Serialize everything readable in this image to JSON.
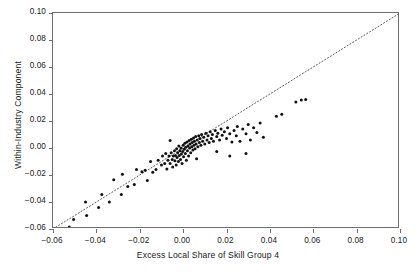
{
  "chart_data": {
    "type": "scatter",
    "title": "",
    "xlabel": "Excess Local Share of Skill Group 4",
    "ylabel": "Within-Industry Component",
    "xlim": [
      -0.06,
      0.1
    ],
    "ylim": [
      -0.06,
      0.1
    ],
    "xticks": [
      -0.06,
      -0.04,
      -0.02,
      0.0,
      0.02,
      0.04,
      0.06,
      0.08,
      0.1
    ],
    "xtick_labels": [
      "-0.06",
      "-0.04",
      "-0.02",
      "0.00",
      "0.02",
      "0.04",
      "0.06",
      "0.08",
      "0.10"
    ],
    "yticks": [
      -0.06,
      -0.04,
      -0.02,
      0.0,
      0.02,
      0.04,
      0.06,
      0.08,
      0.1
    ],
    "ytick_labels": [
      "-0.06",
      "-0.04",
      "-0.02",
      "0.00",
      "0.02",
      "0.04",
      "0.06",
      "0.08",
      "0.10"
    ],
    "grid": false,
    "legend": false,
    "marker_color": "#111111",
    "marker_size": 3.0,
    "reference_line": {
      "name": "45-degree identity line",
      "style": "dotted",
      "color": "#5a5a5a",
      "x0": -0.06,
      "y0": -0.06,
      "x1": 0.1,
      "y1": 0.1
    },
    "series": [
      {
        "name": "Commuting zones",
        "points": [
          [
            -0.0525,
            -0.0585
          ],
          [
            -0.0505,
            -0.053
          ],
          [
            -0.0445,
            -0.05
          ],
          [
            -0.045,
            -0.04
          ],
          [
            -0.0375,
            -0.0345
          ],
          [
            -0.034,
            -0.04
          ],
          [
            -0.032,
            -0.0235
          ],
          [
            -0.0285,
            -0.0345
          ],
          [
            -0.0255,
            -0.0285
          ],
          [
            -0.0225,
            -0.027
          ],
          [
            -0.0215,
            -0.016
          ],
          [
            -0.019,
            -0.0175
          ],
          [
            -0.0175,
            -0.0165
          ],
          [
            -0.015,
            -0.01
          ],
          [
            -0.014,
            -0.018
          ],
          [
            -0.0125,
            -0.016
          ],
          [
            -0.0115,
            -0.009
          ],
          [
            -0.01,
            -0.0125
          ],
          [
            -0.0095,
            -0.006
          ],
          [
            -0.0085,
            -0.0115
          ],
          [
            -0.008,
            -0.004
          ],
          [
            -0.0075,
            -0.0155
          ],
          [
            -0.007,
            -0.009
          ],
          [
            -0.0065,
            -0.006
          ],
          [
            -0.006,
            -0.0115
          ],
          [
            -0.0055,
            -0.0035
          ],
          [
            -0.005,
            -0.0085
          ],
          [
            -0.0048,
            -0.014
          ],
          [
            -0.0045,
            -0.006
          ],
          [
            -0.004,
            -0.002
          ],
          [
            -0.0038,
            -0.0095
          ],
          [
            -0.0035,
            -0.0055
          ],
          [
            -0.0032,
            -0.0125
          ],
          [
            -0.003,
            -0.0005
          ],
          [
            -0.0028,
            -0.007
          ],
          [
            -0.0025,
            -0.0035
          ],
          [
            -0.0022,
            -0.01
          ],
          [
            -0.002,
            0.0015
          ],
          [
            -0.0018,
            -0.0055
          ],
          [
            -0.0015,
            -0.002
          ],
          [
            -0.0012,
            -0.0085
          ],
          [
            -0.001,
            0.0
          ],
          [
            -0.0008,
            -0.0045
          ],
          [
            -0.0005,
            -0.0115
          ],
          [
            -0.0002,
            -0.0025
          ],
          [
            0.0,
            0.002
          ],
          [
            0.0002,
            -0.0065
          ],
          [
            0.0005,
            -0.001
          ],
          [
            0.0008,
            0.0035
          ],
          [
            0.001,
            -0.004
          ],
          [
            0.0012,
            0.0005
          ],
          [
            0.0015,
            -0.009
          ],
          [
            0.0018,
            0.0045
          ],
          [
            0.002,
            -0.002
          ],
          [
            0.0022,
            0.0015
          ],
          [
            0.0025,
            -0.006
          ],
          [
            0.0028,
            0.0055
          ],
          [
            0.003,
            0.0
          ],
          [
            0.0032,
            0.003
          ],
          [
            0.0035,
            -0.0035
          ],
          [
            0.0038,
            0.0065
          ],
          [
            0.004,
            0.001
          ],
          [
            0.0042,
            0.004
          ],
          [
            0.0045,
            -0.0015
          ],
          [
            0.0048,
            0.0075
          ],
          [
            0.005,
            0.002
          ],
          [
            0.0052,
            0.005
          ],
          [
            0.0055,
            -0.0005
          ],
          [
            0.0058,
            0.0085
          ],
          [
            0.006,
            0.003
          ],
          [
            0.0065,
            0.006
          ],
          [
            0.0068,
            0.001
          ],
          [
            0.0072,
            0.009
          ],
          [
            0.0075,
            0.004
          ],
          [
            0.0078,
            0.007
          ],
          [
            0.0082,
            0.002
          ],
          [
            0.0085,
            0.01
          ],
          [
            0.009,
            0.005
          ],
          [
            0.0095,
            0.008
          ],
          [
            0.01,
            0.003
          ],
          [
            0.0105,
            0.011
          ],
          [
            0.011,
            0.006
          ],
          [
            0.0115,
            0.009
          ],
          [
            0.012,
            0.004
          ],
          [
            0.0125,
            0.012
          ],
          [
            0.013,
            0.007
          ],
          [
            0.0135,
            0.01
          ],
          [
            0.014,
            0.005
          ],
          [
            0.0148,
            0.013
          ],
          [
            0.0155,
            0.0085
          ],
          [
            0.016,
            0.011
          ],
          [
            0.0168,
            0.006
          ],
          [
            0.0175,
            0.014
          ],
          [
            0.018,
            0.0095
          ],
          [
            0.019,
            0.012
          ],
          [
            0.02,
            0.007
          ],
          [
            0.0205,
            0.015
          ],
          [
            0.0215,
            0.0105
          ],
          [
            0.0225,
            0.0045
          ],
          [
            0.0235,
            0.013
          ],
          [
            0.0245,
            0.009
          ],
          [
            0.025,
            0.016
          ],
          [
            0.0262,
            0.005
          ],
          [
            0.0275,
            0.014
          ],
          [
            0.029,
            0.0105
          ],
          [
            0.03,
            0.0175
          ],
          [
            0.031,
            0.006
          ],
          [
            0.0325,
            0.015
          ],
          [
            0.034,
            0.0115
          ],
          [
            0.0355,
            0.0185
          ],
          [
            0.037,
            0.008
          ],
          [
            0.029,
            -0.004
          ],
          [
            0.0215,
            -0.006
          ],
          [
            0.043,
            0.0235
          ],
          [
            0.0455,
            0.025
          ],
          [
            0.052,
            0.034
          ],
          [
            0.0545,
            0.0355
          ],
          [
            0.0565,
            0.036
          ],
          [
            -0.039,
            -0.044
          ],
          [
            -0.028,
            -0.0195
          ],
          [
            -0.0165,
            -0.024
          ],
          [
            -0.006,
            0.0055
          ],
          [
            0.0062,
            -0.008
          ],
          [
            0.0155,
            -0.0025
          ]
        ]
      }
    ]
  }
}
